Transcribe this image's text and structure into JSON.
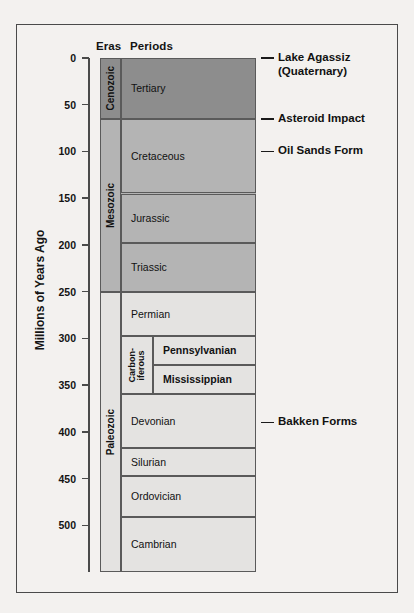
{
  "figure": {
    "y_axis_label": "Millions of Years Ago",
    "headers": {
      "eras": "Eras",
      "periods": "Periods"
    }
  },
  "chart_data": {
    "type": "table",
    "ylabel": "Millions of Years Ago",
    "ylim": [
      0,
      550
    ],
    "y_direction": "inverted",
    "grid": false,
    "tick_labels": [
      "0",
      "50",
      "100",
      "150",
      "200",
      "250",
      "300",
      "350",
      "400",
      "450",
      "500"
    ],
    "ticks": [
      0,
      50,
      100,
      150,
      200,
      250,
      300,
      350,
      400,
      450,
      500
    ],
    "colors": {
      "cenozoic": "#8d8d8d",
      "mesozoic": "#b4b4b4",
      "paleozoic": "#e4e3e1",
      "border": "#5a5a5a",
      "frame": "#4a4a4a",
      "page": "#f3f1ef"
    },
    "eras": [
      {
        "name": "Cenozoic",
        "start": 0,
        "end": 65,
        "color": "#8d8d8d"
      },
      {
        "name": "Mesozoic",
        "start": 65,
        "end": 250,
        "color": "#b4b4b4"
      },
      {
        "name": "Paleozoic",
        "start": 250,
        "end": 550,
        "color": "#e4e3e1"
      }
    ],
    "periods": [
      {
        "name": "Tertiary",
        "start": 0,
        "end": 65,
        "era": "Cenozoic"
      },
      {
        "name": "Cretaceous",
        "start": 65,
        "end": 145,
        "era": "Mesozoic"
      },
      {
        "name": "Jurassic",
        "start": 145,
        "end": 198,
        "era": "Mesozoic"
      },
      {
        "name": "Triassic",
        "start": 198,
        "end": 250,
        "era": "Mesozoic"
      },
      {
        "name": "Permian",
        "start": 250,
        "end": 297,
        "era": "Paleozoic"
      },
      {
        "name": "Carboniferous",
        "start": 297,
        "end": 360,
        "era": "Paleozoic",
        "subperiods": [
          {
            "name": "Pennsylvanian",
            "start": 297,
            "end": 328
          },
          {
            "name": "Mississippian",
            "start": 328,
            "end": 360
          }
        ]
      },
      {
        "name": "Devonian",
        "start": 360,
        "end": 417,
        "era": "Paleozoic"
      },
      {
        "name": "Silurian",
        "start": 417,
        "end": 447,
        "era": "Paleozoic"
      },
      {
        "name": "Ordovician",
        "start": 447,
        "end": 491,
        "era": "Paleozoic"
      },
      {
        "name": "Cambrian",
        "start": 491,
        "end": 550,
        "era": "Paleozoic"
      }
    ],
    "annotations": [
      {
        "label": "Lake Agassiz\n(Quaternary)",
        "at": 0
      },
      {
        "label": "Asteroid Impact",
        "at": 65
      },
      {
        "label": "Oil Sands Form",
        "at": 100
      },
      {
        "label": "Bakken Forms",
        "at": 390
      }
    ]
  }
}
